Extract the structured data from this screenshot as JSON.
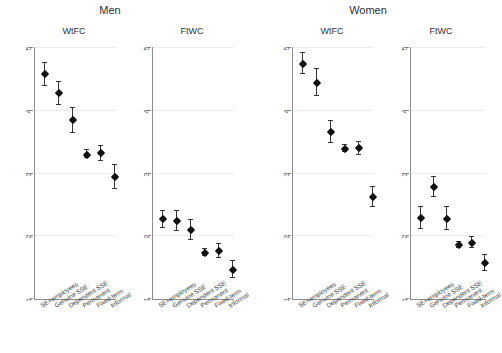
{
  "figure": {
    "width": 489,
    "height": 353,
    "background": "#ffffff",
    "marker_color": "#111111",
    "errorbar_color": "#333333",
    "axis_color": "#8d8d8d",
    "grid_color": "#ececec"
  },
  "groups": [
    {
      "label": "Men"
    },
    {
      "label": "Women"
    }
  ],
  "chart_data": {
    "type": "scatter",
    "title": "",
    "xlabel": "",
    "ylabel": "",
    "ylim": [
      1,
      5
    ],
    "yticks": [
      1,
      2,
      3,
      4,
      5
    ],
    "ytick_labels": [
      "1",
      "2",
      "3",
      "4",
      "5"
    ],
    "grid": true,
    "legend": "none",
    "categories": [
      "SE+employees",
      "Genuine SSE",
      "Dependent SSE",
      "Permanent",
      "Fixed-term",
      "Informal"
    ],
    "panels": [
      {
        "group": "Men",
        "name": "WtFC",
        "values": [
          4.58,
          4.28,
          3.85,
          3.3,
          3.32,
          2.94
        ],
        "ci_low": [
          4.4,
          4.09,
          3.65,
          3.24,
          3.2,
          2.75
        ],
        "ci_high": [
          4.76,
          4.46,
          4.04,
          3.37,
          3.44,
          3.13
        ]
      },
      {
        "group": "Men",
        "name": "FtWC",
        "values": [
          2.27,
          2.25,
          2.1,
          1.73,
          1.77,
          1.47
        ],
        "ci_low": [
          2.13,
          2.09,
          1.94,
          1.68,
          1.66,
          1.33
        ],
        "ci_high": [
          2.41,
          2.41,
          2.26,
          1.79,
          1.88,
          1.61
        ]
      },
      {
        "group": "Women",
        "name": "WtFC",
        "values": [
          4.75,
          4.45,
          3.66,
          3.39,
          3.4,
          2.63
        ],
        "ci_low": [
          4.58,
          4.24,
          3.48,
          3.34,
          3.3,
          2.47
        ],
        "ci_high": [
          4.92,
          4.66,
          3.84,
          3.45,
          3.5,
          2.79
        ]
      },
      {
        "group": "Women",
        "name": "FtWC",
        "values": [
          2.29,
          2.78,
          2.28,
          1.86,
          1.9,
          1.57
        ],
        "ci_low": [
          2.12,
          2.62,
          2.1,
          1.82,
          1.82,
          1.45
        ],
        "ci_high": [
          2.46,
          2.94,
          2.46,
          1.91,
          1.99,
          1.7
        ]
      }
    ]
  }
}
